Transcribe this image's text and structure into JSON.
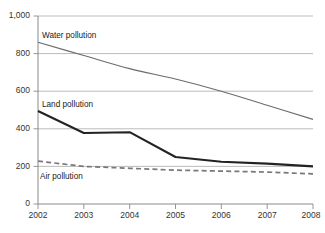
{
  "chart_data": {
    "type": "line",
    "title": "",
    "subtitle": "",
    "xlabel": "",
    "ylabel": "",
    "categories": [
      "2002",
      "2003",
      "2004",
      "2005",
      "2006",
      "2007",
      "2008"
    ],
    "x": [
      2002,
      2003,
      2004,
      2005,
      2006,
      2007,
      2008
    ],
    "xlim": [
      2002,
      2008
    ],
    "ylim": [
      0,
      1000
    ],
    "y_ticks": [
      0,
      200,
      400,
      600,
      800,
      1000
    ],
    "y_tick_labels": [
      "0",
      "200",
      "400",
      "600",
      "800",
      "1,000"
    ],
    "grid": "horizontal",
    "legend": "inline-labels",
    "series": [
      {
        "name": "Water pollution",
        "label": "Water pollution",
        "color": "#6b6b6b",
        "style": "solid-thin",
        "values": [
          860,
          790,
          720,
          665,
          600,
          525,
          450
        ]
      },
      {
        "name": "Land pollution",
        "label": "Land pollution",
        "color": "#232323",
        "style": "solid-thick",
        "values": [
          495,
          378,
          382,
          250,
          225,
          215,
          200
        ]
      },
      {
        "name": "Air pollution",
        "label": "Air pollution",
        "color": "#787878",
        "style": "dashed",
        "values": [
          228,
          200,
          190,
          180,
          175,
          170,
          160
        ]
      }
    ],
    "annotations": [
      {
        "text": "Water pollution",
        "x": 2002.9,
        "y": 905
      },
      {
        "text": "Land pollution",
        "x": 2002.9,
        "y": 540
      },
      {
        "text": "Air pollution",
        "x": 2002.35,
        "y": 150
      }
    ]
  },
  "caption": {
    "text": ""
  }
}
